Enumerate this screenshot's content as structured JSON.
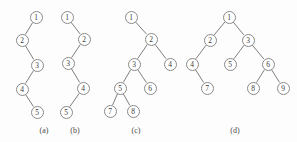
{
  "figure": {
    "width": 297,
    "height": 142,
    "background_color": "#fdfdfd",
    "node_stroke_color": "#8a8a8a",
    "edge_stroke_color": "#6f6f6f",
    "label_color": "#3a3a3a",
    "node_diameter": 13
  },
  "trees": [
    {
      "id": "tree-a",
      "caption": "(a)",
      "caption_x": 44,
      "caption_y": 126,
      "nodes": [
        {
          "label": "1",
          "x": 36,
          "y": 17
        },
        {
          "label": "2",
          "x": 22,
          "y": 40
        },
        {
          "label": "3",
          "x": 37,
          "y": 65
        },
        {
          "label": "4",
          "x": 22,
          "y": 89
        },
        {
          "label": "5",
          "x": 37,
          "y": 112
        }
      ],
      "edges": [
        {
          "from": 0,
          "to": 1
        },
        {
          "from": 1,
          "to": 2
        },
        {
          "from": 2,
          "to": 3
        },
        {
          "from": 3,
          "to": 4
        }
      ]
    },
    {
      "id": "tree-b",
      "caption": "(b)",
      "caption_x": 75,
      "caption_y": 126,
      "nodes": [
        {
          "label": "1",
          "x": 67,
          "y": 17
        },
        {
          "label": "2",
          "x": 84,
          "y": 39
        },
        {
          "label": "3",
          "x": 68,
          "y": 63
        },
        {
          "label": "4",
          "x": 83,
          "y": 88
        },
        {
          "label": "5",
          "x": 66,
          "y": 112
        }
      ],
      "edges": [
        {
          "from": 0,
          "to": 1
        },
        {
          "from": 1,
          "to": 2
        },
        {
          "from": 2,
          "to": 3
        },
        {
          "from": 3,
          "to": 4
        }
      ]
    },
    {
      "id": "tree-c",
      "caption": "(c)",
      "caption_x": 136,
      "caption_y": 126,
      "nodes": [
        {
          "label": "1",
          "x": 131,
          "y": 17
        },
        {
          "label": "2",
          "x": 151,
          "y": 39
        },
        {
          "label": "3",
          "x": 134,
          "y": 64
        },
        {
          "label": "4",
          "x": 170,
          "y": 64
        },
        {
          "label": "5",
          "x": 120,
          "y": 88
        },
        {
          "label": "6",
          "x": 150,
          "y": 88
        },
        {
          "label": "7",
          "x": 110,
          "y": 111
        },
        {
          "label": "8",
          "x": 133,
          "y": 111
        }
      ],
      "edges": [
        {
          "from": 0,
          "to": 1
        },
        {
          "from": 1,
          "to": 2
        },
        {
          "from": 1,
          "to": 3
        },
        {
          "from": 2,
          "to": 4
        },
        {
          "from": 2,
          "to": 5
        },
        {
          "from": 4,
          "to": 6
        },
        {
          "from": 4,
          "to": 7
        }
      ]
    },
    {
      "id": "tree-d",
      "caption": "(d)",
      "caption_x": 235,
      "caption_y": 126,
      "nodes": [
        {
          "label": "1",
          "x": 229,
          "y": 17
        },
        {
          "label": "2",
          "x": 210,
          "y": 40
        },
        {
          "label": "3",
          "x": 248,
          "y": 40
        },
        {
          "label": "4",
          "x": 192,
          "y": 64
        },
        {
          "label": "5",
          "x": 230,
          "y": 64
        },
        {
          "label": "6",
          "x": 268,
          "y": 64
        },
        {
          "label": "7",
          "x": 207,
          "y": 88
        },
        {
          "label": "8",
          "x": 253,
          "y": 88
        },
        {
          "label": "9",
          "x": 283,
          "y": 88
        }
      ],
      "edges": [
        {
          "from": 0,
          "to": 1
        },
        {
          "from": 0,
          "to": 2
        },
        {
          "from": 1,
          "to": 3
        },
        {
          "from": 3,
          "to": 6
        },
        {
          "from": 2,
          "to": 4
        },
        {
          "from": 2,
          "to": 5
        },
        {
          "from": 5,
          "to": 7
        },
        {
          "from": 5,
          "to": 8
        }
      ]
    }
  ]
}
